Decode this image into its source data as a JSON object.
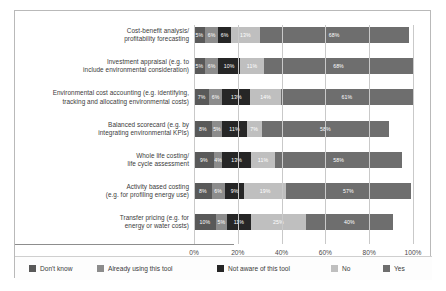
{
  "chart_data": {
    "type": "bar",
    "orientation": "horizontal",
    "stacked": true,
    "title": "",
    "subtitle": "",
    "xlabel": "",
    "ylabel": "",
    "xlim": [
      0,
      100
    ],
    "grid": true,
    "legend_position": "bottom",
    "xticks": [
      "0%",
      "20%",
      "40%",
      "60%",
      "80%",
      "100%"
    ],
    "xtick_values": [
      0,
      20,
      40,
      60,
      80,
      100
    ],
    "categories": [
      "Cost-benefit analysis/\nprofitability forecasting",
      "Investment appraisal (e.g. to\ninclude environmental consideration)",
      "Environmental cost accounting (e.g. identifying,\ntracking and allocating environmental costs)",
      "Balanced scorecard (e.g. by\nintegrating environmental KPIs)",
      "Whole life costing/\nlife cycle assessment",
      "Activity based costing\n(e.g. for profiling energy use)",
      "Transfer pricing (e.g. for\nenergy or water costs)"
    ],
    "category_lines": [
      [
        "Cost-benefit analysis/",
        "profitability forecasting"
      ],
      [
        "Investment appraisal (e.g. to",
        "include environmental consideration)"
      ],
      [
        "Environmental cost accounting (e.g. identifying,",
        "tracking and allocating environmental costs)"
      ],
      [
        "Balanced scorecard (e.g. by",
        "integrating environmental KPIs)"
      ],
      [
        "Whole life costing/",
        "life cycle assessment"
      ],
      [
        "Activity based costing",
        "(e.g. for profiling energy use)"
      ],
      [
        "Transfer pricing (e.g. for",
        "energy or water costs)"
      ]
    ],
    "series": [
      {
        "name": "Don't know",
        "color": "#595959",
        "values": [
          5,
          5,
          7,
          8,
          9,
          8,
          10
        ],
        "labels": [
          "5%",
          "5%",
          "7%",
          "8%",
          "9%",
          "8%",
          "10%"
        ]
      },
      {
        "name": "Already using this tool",
        "color": "#8c8c8c",
        "values": [
          6,
          6,
          6,
          5,
          4,
          6,
          5
        ],
        "labels": [
          "6%",
          "6%",
          "6%",
          "5%",
          "4%",
          "6%",
          "5%"
        ]
      },
      {
        "name": "Not aware of this tool",
        "color": "#262626",
        "values": [
          6,
          10,
          13,
          11,
          13,
          9,
          11
        ],
        "labels": [
          "6%",
          "10%",
          "13%",
          "11%",
          "13%",
          "9%",
          "11%"
        ]
      },
      {
        "name": "No",
        "color": "#bfbfbf",
        "values": [
          13,
          11,
          14,
          7,
          11,
          19,
          25
        ],
        "labels": [
          "13%",
          "11%",
          "14%",
          "7%",
          "11%",
          "19%",
          "25%"
        ]
      },
      {
        "name": "Yes",
        "color": "#6e6e6e",
        "values": [
          68,
          68,
          61,
          58,
          58,
          57,
          40
        ],
        "labels": [
          "68%",
          "68%",
          "61%",
          "58%",
          "58%",
          "57%",
          "40%"
        ]
      }
    ]
  },
  "legend": {
    "items": [
      {
        "label": "Don't know",
        "color": "#595959"
      },
      {
        "label": "Already using this tool",
        "color": "#8c8c8c"
      },
      {
        "label": "Not aware of this tool",
        "color": "#262626"
      },
      {
        "label": "No",
        "color": "#bfbfbf"
      },
      {
        "label": "Yes",
        "color": "#6e6e6e"
      }
    ]
  },
  "colors": {
    "frame_border": "#b9b9b9",
    "gridline": "#c9c9c9",
    "axis": "#8d8d8d",
    "text": "#3b3b3b",
    "background": "#ffffff"
  }
}
